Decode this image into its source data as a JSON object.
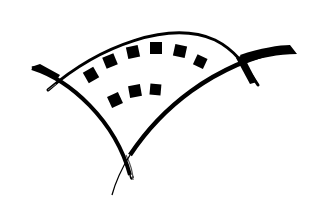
{
  "image": {
    "width": 314,
    "height": 211,
    "background": "#ffffff",
    "ink": "#000000",
    "subject": "film-strip-arc-logo",
    "dots_top_row": 6,
    "dots_bottom_row": 3
  }
}
